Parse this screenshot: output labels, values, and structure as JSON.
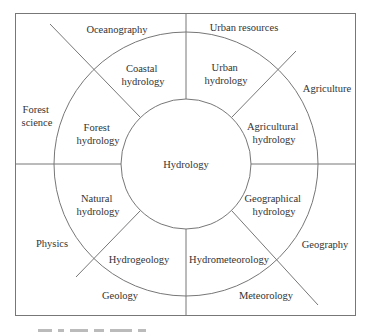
{
  "diagram": {
    "type": "concentric-domain-diagram",
    "center": {
      "label": "Hydrology"
    },
    "inner_ring": [
      {
        "id": "coastal",
        "line1": "Coastal",
        "line2": "hydrology"
      },
      {
        "id": "urban",
        "line1": "Urban",
        "line2": "hydrology"
      },
      {
        "id": "forest",
        "line1": "Forest",
        "line2": "hydrology"
      },
      {
        "id": "agricultural",
        "line1": "Agricultural",
        "line2": "hydrology"
      },
      {
        "id": "natural",
        "line1": "Natural",
        "line2": "hydrology"
      },
      {
        "id": "geographical",
        "line1": "Geographical",
        "line2": "hydrology"
      },
      {
        "id": "hydrogeology",
        "line1": "Hydrogeology"
      },
      {
        "id": "hydrometeorology",
        "line1": "Hydrometeorology"
      }
    ],
    "outer_ring": [
      {
        "id": "oceanography",
        "line1": "Oceanography"
      },
      {
        "id": "urban-resources",
        "line1": "Urban resources"
      },
      {
        "id": "forest-science",
        "line1": "Forest",
        "line2": "science"
      },
      {
        "id": "agriculture",
        "line1": "Agriculture"
      },
      {
        "id": "physics",
        "line1": "Physics"
      },
      {
        "id": "geography",
        "line1": "Geography"
      },
      {
        "id": "geology",
        "line1": "Geology"
      },
      {
        "id": "meteorology",
        "line1": "Meteorology"
      }
    ],
    "colors": {
      "line": "#777777",
      "text": "#333333",
      "background": "#ffffff"
    }
  }
}
